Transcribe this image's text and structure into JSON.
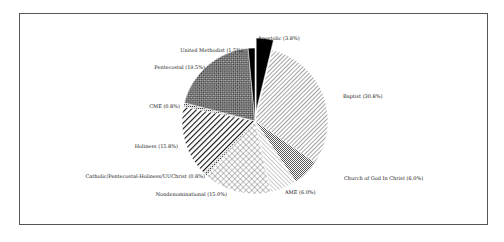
{
  "chart_data": {
    "type": "pie",
    "title": "",
    "start_angle_deg": 0,
    "direction": "clockwise",
    "exploded": [
      "Apostolic"
    ],
    "slices": [
      {
        "label": "Apostolic",
        "value": 3.8,
        "display": "Apostolic (3.8%)",
        "pattern": "solid"
      },
      {
        "label": "Baptist",
        "value": 30.8,
        "display": "Baptist (30.8%)",
        "pattern": "diag-fine"
      },
      {
        "label": "Church of God In Christ",
        "value": 6.0,
        "display": "Church of God In Christ (6.0%)",
        "pattern": "grid-fine"
      },
      {
        "label": "AME",
        "value": 6.0,
        "display": "AME (6.0%)",
        "pattern": "diag-light"
      },
      {
        "label": "Nondenominational",
        "value": 15.0,
        "display": "Nondenominational (15.0%)",
        "pattern": "crosshatch"
      },
      {
        "label": "Catholic/Pentecostal-Holiness/UUChrist",
        "value": 0.8,
        "display": "Catholic/Pentecostal-Holiness/UUChrist (0.8%)",
        "pattern": "dots"
      },
      {
        "label": "Holiness",
        "value": 15.8,
        "display": "Holiness (15.8%)",
        "pattern": "diag-bold"
      },
      {
        "label": "CME",
        "value": 0.8,
        "display": "CME (0.8%)",
        "pattern": "dots"
      },
      {
        "label": "Pentecostal",
        "value": 19.5,
        "display": "Pentecostal (19.5%)",
        "pattern": "checker"
      },
      {
        "label": "United Methodist",
        "value": 1.5,
        "display": "United Methodist (1.5%)",
        "pattern": "solid"
      }
    ],
    "labels_pos": [
      {
        "x": 258,
        "y": 40,
        "anchor": "start"
      },
      {
        "x": 343,
        "y": 98,
        "anchor": "start"
      },
      {
        "x": 344,
        "y": 180,
        "anchor": "start"
      },
      {
        "x": 285,
        "y": 194,
        "anchor": "start"
      },
      {
        "x": 227,
        "y": 196,
        "anchor": "end"
      },
      {
        "x": 205,
        "y": 178,
        "anchor": "end"
      },
      {
        "x": 178,
        "y": 148,
        "anchor": "end"
      },
      {
        "x": 180,
        "y": 108,
        "anchor": "end"
      },
      {
        "x": 205,
        "y": 69,
        "anchor": "end"
      },
      {
        "x": 243,
        "y": 52,
        "anchor": "end"
      }
    ],
    "center": {
      "x": 255,
      "y": 121
    },
    "radius": 73
  }
}
